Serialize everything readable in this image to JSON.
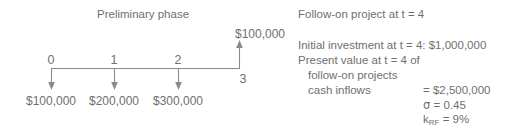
{
  "figure": {
    "left_panel": {
      "title": "Preliminary phase",
      "axis": {
        "tick_labels": [
          "0",
          "1",
          "2",
          "3"
        ],
        "outflow_labels": [
          "$100,000",
          "$200,000",
          "$300,000"
        ],
        "inflow_label": "$100,000"
      }
    },
    "right_panel": {
      "heading": "Follow-on project at t = 4",
      "lines": [
        "Initial investment at t = 4: $1,000,000",
        "Present value at t = 4 of",
        "follow-on projects",
        "cash inflows"
      ],
      "values": [
        "= $2,500,000",
        "= 0.45",
        "= 9%"
      ],
      "symbols": {
        "sigma": "σ",
        "k": "k",
        "k_sub": "RF"
      }
    }
  },
  "style": {
    "ink": "#6f6f6f",
    "background": "#ffffff"
  }
}
